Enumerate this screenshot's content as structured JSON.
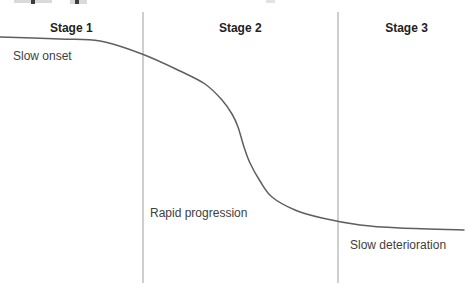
{
  "figure": {
    "stages": [
      {
        "label": "Stage 1",
        "annotation": "Slow onset"
      },
      {
        "label": "Stage 2",
        "annotation": "Rapid progression"
      },
      {
        "label": "Stage 3",
        "annotation": "Slow deterioration"
      }
    ],
    "colors": {
      "background": "#ffffff",
      "curve": "#5f5f5f",
      "divider": "#cfcfcf",
      "stage_label_text": "#222222",
      "annotation_text": "#3e3e3e"
    }
  },
  "chart_data": {
    "type": "line",
    "title": "",
    "xlabel": "",
    "ylabel": "",
    "axes_visible": false,
    "grid": false,
    "legend": false,
    "stage_labels": [
      "Stage 1",
      "Stage 2",
      "Stage 3"
    ],
    "annotations": [
      "Slow onset",
      "Rapid progression",
      "Slow deterioration"
    ],
    "stage_dividers_x_px": [
      142.5,
      338
    ],
    "canvas_px": [
      475,
      290
    ],
    "curve_points_px": [
      [
        0,
        37
      ],
      [
        60,
        39
      ],
      [
        100,
        41
      ],
      [
        142,
        54
      ],
      [
        180,
        71
      ],
      [
        205,
        84
      ],
      [
        222,
        100
      ],
      [
        232,
        114
      ],
      [
        238,
        127
      ],
      [
        244,
        147
      ],
      [
        250,
        163
      ],
      [
        260,
        181
      ],
      [
        272,
        197
      ],
      [
        295,
        210
      ],
      [
        322,
        218
      ],
      [
        360,
        225
      ],
      [
        400,
        228
      ],
      [
        464,
        230
      ]
    ]
  }
}
